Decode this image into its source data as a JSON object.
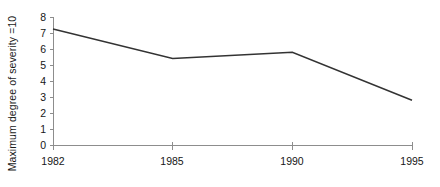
{
  "chart_data": {
    "type": "line",
    "title": "",
    "subtitle": "",
    "xlabel": "",
    "ylabel": "Maximum degree of severity =10",
    "categories": [
      "1982",
      "1985",
      "1990",
      "1995"
    ],
    "x": [
      1982,
      1985,
      1990,
      1995
    ],
    "values": [
      7.25,
      5.4,
      5.8,
      2.8
    ],
    "series": [
      {
        "name": "Maximum degree of severity",
        "values": [
          7.25,
          5.4,
          5.8,
          2.8
        ]
      }
    ],
    "ylim": [
      0,
      8
    ],
    "yticks": [
      0,
      1,
      2,
      3,
      4,
      5,
      6,
      7,
      8
    ],
    "ytick_labels": [
      "0",
      "1",
      "2",
      "3",
      "4",
      "5",
      "6",
      "7",
      "8"
    ],
    "xtick_labels": [
      "1982",
      "1985",
      "1990",
      "1995"
    ],
    "grid": false,
    "legend": false,
    "legend_position": "none",
    "annotations": [],
    "axis_spacing_note": "categorical equal spacing",
    "colors": {
      "line": "#333333",
      "axis": "#8d8d8d",
      "text": "#161616",
      "background": "#ffffff"
    }
  },
  "layout": {
    "plot_left": 53,
    "plot_right": 412,
    "plot_top": 17,
    "plot_bottom": 145
  }
}
